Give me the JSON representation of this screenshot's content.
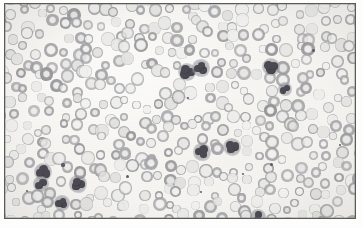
{
  "figure": {
    "kind": "micrograph",
    "stain": "Wright-Giemsa (desaturated / grayscale reproduction)",
    "caption": "",
    "width": 363,
    "height": 228
  },
  "frame": {
    "visible": true,
    "color": "#5a5a5a",
    "inset_left": 4,
    "inset_top": 3,
    "width": 352,
    "height": 216
  },
  "palette": {
    "page_background": "#ffffff",
    "field_background": "#f7f6f3",
    "rbc_rim": "#9b9a9e",
    "rbc_pallor": "#ebeae8",
    "wbc_nucleus": "#4b4a52",
    "wbc_nucleus_dark": "#35343c",
    "wbc_cytoplasm": "#8f8e96",
    "platelet": "#5d5d63",
    "frame_line": "#5a5a5a"
  },
  "counts": {
    "red_blood_cells": 420,
    "white_blood_cells": 11,
    "platelets": 9
  },
  "chart_data": {
    "type": "scatter",
    "title": "",
    "xlabel": "",
    "ylabel": "",
    "xlim": [
      0,
      350
    ],
    "ylim": [
      0,
      214
    ],
    "grid": false,
    "legend": null,
    "series": [
      {
        "name": "white-blood-cells",
        "color": "#4b4a52",
        "points": [
          {
            "x": 182,
            "y": 68,
            "r": 7.5,
            "lobes": 3,
            "note": "neutrophil-cluster-left"
          },
          {
            "x": 196,
            "y": 64,
            "r": 7.0,
            "lobes": 3,
            "note": "neutrophil-cluster-right"
          },
          {
            "x": 266,
            "y": 63,
            "r": 7.5,
            "lobes": 3,
            "note": "neutrophil-upper-right"
          },
          {
            "x": 280,
            "y": 85,
            "r": 5.5,
            "lobes": 2,
            "note": "lymphocyte-right"
          },
          {
            "x": 197,
            "y": 148,
            "r": 7.0,
            "lobes": 3,
            "note": "neutrophil-center-low"
          },
          {
            "x": 227,
            "y": 143,
            "r": 7.5,
            "lobes": 3,
            "note": "neutrophil-center-right"
          },
          {
            "x": 38,
            "y": 168,
            "r": 7.5,
            "lobes": 3,
            "note": "neutrophil-lower-left-upper"
          },
          {
            "x": 36,
            "y": 180,
            "r": 6.5,
            "lobes": 2,
            "note": "neutrophil-lower-left-lower"
          },
          {
            "x": 73,
            "y": 180,
            "r": 7.0,
            "lobes": 3,
            "note": "neutrophil-lower-left-right"
          },
          {
            "x": 57,
            "y": 199,
            "r": 6.5,
            "lobes": 3,
            "note": "neutrophil-bottom-left"
          },
          {
            "x": 253,
            "y": 213,
            "r": 6.5,
            "lobes": 2,
            "note": "neutrophil-bottom-edge"
          }
        ]
      },
      {
        "name": "platelets-and-debris",
        "color": "#5d5d63",
        "points": [
          {
            "x": 58,
            "y": 161,
            "r": 1.6
          },
          {
            "x": 122,
            "y": 172,
            "r": 1.5
          },
          {
            "x": 196,
            "y": 188,
            "r": 1.4
          },
          {
            "x": 238,
            "y": 170,
            "r": 1.3
          },
          {
            "x": 266,
            "y": 160,
            "r": 1.5
          },
          {
            "x": 308,
            "y": 46,
            "r": 1.5
          },
          {
            "x": 22,
            "y": 187,
            "r": 1.3
          },
          {
            "x": 335,
            "y": 141,
            "r": 1.4
          },
          {
            "x": 183,
            "y": 94,
            "r": 1.3
          }
        ]
      }
    ],
    "rbc_layout": {
      "description": "Dense monolayer of erythrocytes filling the field; generated on a jittered grid with ~13px spacing, radius 4-7px, gray rims with central pallor.",
      "spacing": 13,
      "radius_min": 4.0,
      "radius_max": 7.0,
      "jitter": 5.5,
      "rim_color": "#9b9a9e",
      "pallor_color": "#ebeae8",
      "seed": 20240517
    }
  }
}
